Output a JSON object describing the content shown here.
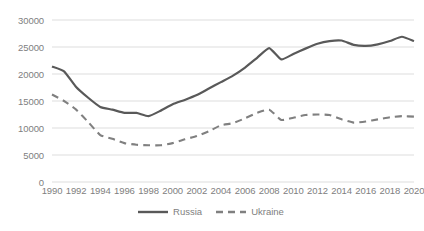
{
  "chart_data": {
    "type": "line",
    "title": "",
    "subtitle": "",
    "xlabel": "",
    "ylabel": "",
    "grid": true,
    "legend_position": "bottom",
    "ylim": [
      0,
      30000
    ],
    "yticks": [
      0,
      5000,
      10000,
      15000,
      20000,
      25000,
      30000
    ],
    "ytick_labels": [
      "0",
      "5000",
      "10000",
      "15000",
      "20000",
      "25000",
      "30000"
    ],
    "xlim": [
      1990,
      2020
    ],
    "xticks": [
      1990,
      1992,
      1994,
      1996,
      1998,
      2000,
      2002,
      2004,
      2006,
      2008,
      2010,
      2012,
      2014,
      2016,
      2018,
      2020
    ],
    "xtick_labels": [
      "1990",
      "1992",
      "1994",
      "1996",
      "1998",
      "2000",
      "2002",
      "2004",
      "2006",
      "2008",
      "2010",
      "2012",
      "2014",
      "2016",
      "2018",
      "2020"
    ],
    "x": [
      1990,
      1991,
      1992,
      1993,
      1994,
      1995,
      1996,
      1997,
      1998,
      1999,
      2000,
      2001,
      2002,
      2003,
      2004,
      2005,
      2006,
      2007,
      2008,
      2009,
      2010,
      2011,
      2012,
      2013,
      2014,
      2015,
      2016,
      2017,
      2018,
      2019,
      2020
    ],
    "series": [
      {
        "name": "Russia",
        "style": "solid",
        "color": "#595959",
        "values": [
          21400,
          20500,
          17600,
          15600,
          13900,
          13400,
          12800,
          12800,
          12200,
          13200,
          14400,
          15200,
          16100,
          17300,
          18500,
          19700,
          21200,
          23000,
          24800,
          22700,
          23700,
          24700,
          25600,
          26100,
          26200,
          25400,
          25200,
          25500,
          26100,
          26900,
          26100
        ]
      },
      {
        "name": "Ukraine",
        "style": "dashed",
        "color": "#808080",
        "values": [
          16200,
          15000,
          13400,
          11100,
          8700,
          8000,
          7200,
          6900,
          6800,
          6800,
          7200,
          7900,
          8500,
          9400,
          10500,
          10900,
          11800,
          12800,
          13400,
          11500,
          11900,
          12400,
          12500,
          12400,
          11600,
          11000,
          11200,
          11600,
          12000,
          12200,
          12100
        ]
      }
    ]
  },
  "legend": {
    "items": [
      {
        "label": "Russia"
      },
      {
        "label": "Ukraine"
      }
    ]
  }
}
